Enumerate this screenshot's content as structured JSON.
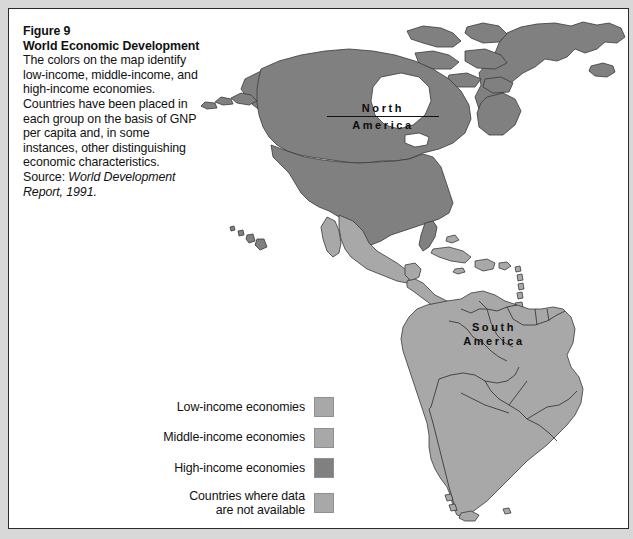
{
  "figure": {
    "number": "Figure 9",
    "title": "World Economic Development",
    "caption_body": "The colors on the map identify low-income, middle-income, and high-income economies. Countries have been placed in each group on the basis of GNP per capita and, in some instances, other distinguishing economic characteristics. Source: ",
    "caption_source_italic": "World Development Report, 1991."
  },
  "map": {
    "labels": [
      {
        "name": "north-america",
        "line1": "North",
        "line2": "America",
        "underline": true
      },
      {
        "name": "south-america",
        "line1": "South",
        "line2": "America",
        "underline": false
      }
    ],
    "colors": {
      "low_income": "#a8a8a8",
      "middle_income": "#a8a8a8",
      "high_income": "#808080",
      "no_data": "#a8a8a8",
      "ocean": "#ffffff",
      "border_stroke": "#3a3a3a",
      "page_background": "#d8d8d8",
      "frame_background": "#ffffff",
      "frame_border": "#2b2b2b"
    },
    "regions": [
      {
        "name": "greenland",
        "category": "high_income"
      },
      {
        "name": "canada",
        "category": "high_income"
      },
      {
        "name": "united-states",
        "category": "high_income"
      },
      {
        "name": "alaska",
        "category": "high_income"
      },
      {
        "name": "mexico",
        "category": "middle_income"
      },
      {
        "name": "central-america",
        "category": "low_income"
      },
      {
        "name": "caribbean-islands",
        "category": "middle_income"
      },
      {
        "name": "hawaii",
        "category": "high_income"
      },
      {
        "name": "colombia",
        "category": "middle_income"
      },
      {
        "name": "venezuela",
        "category": "middle_income"
      },
      {
        "name": "guyanas",
        "category": "middle_income"
      },
      {
        "name": "ecuador",
        "category": "middle_income"
      },
      {
        "name": "peru",
        "category": "middle_income"
      },
      {
        "name": "brazil",
        "category": "middle_income"
      },
      {
        "name": "bolivia",
        "category": "middle_income"
      },
      {
        "name": "paraguay",
        "category": "middle_income"
      },
      {
        "name": "chile",
        "category": "middle_income"
      },
      {
        "name": "argentina",
        "category": "middle_income"
      },
      {
        "name": "uruguay",
        "category": "middle_income"
      }
    ]
  },
  "legend": {
    "items": [
      {
        "label": "Low-income economies",
        "color": "#a8a8a8",
        "key": "low-income"
      },
      {
        "label": "Middle-income economies",
        "color": "#a8a8a8",
        "key": "middle-income"
      },
      {
        "label": "High-income economies",
        "color": "#808080",
        "key": "high-income"
      },
      {
        "label": "Countries where data\nare not available",
        "color": "#a8a8a8",
        "key": "no-data"
      }
    ]
  }
}
